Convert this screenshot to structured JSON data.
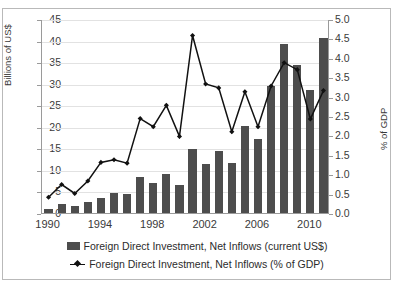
{
  "chart_data": {
    "type": "bar",
    "title": "",
    "xlabel": "",
    "ylabel": "Billions of US$",
    "y2label": "% of GDP",
    "grid": true,
    "legend_position": "bottom",
    "categories": [
      "1990",
      "1991",
      "1992",
      "1993",
      "1994",
      "1995",
      "1996",
      "1997",
      "1998",
      "1999",
      "2000",
      "2001",
      "2002",
      "2003",
      "2004",
      "2005",
      "2006",
      "2007",
      "2008",
      "2009",
      "2010",
      "2011"
    ],
    "xtick_labels": [
      "1990",
      "1994",
      "1998",
      "2002",
      "2006",
      "2010"
    ],
    "ylim": [
      0,
      45
    ],
    "ytick_labels": [
      "0",
      "5",
      "10",
      "15",
      "20",
      "25",
      "30",
      "35",
      "40",
      "45"
    ],
    "y2lim": [
      0,
      5.0
    ],
    "y2tick_labels": [
      "0.0",
      "0.5",
      "1.0",
      "1.5",
      "2.0",
      "2.5",
      "3.0",
      "3.5",
      "4.0",
      "4.5",
      "5.0"
    ],
    "series": [
      {
        "name": "Foreign Direct Investment, Net Inflows (current US$)",
        "kind": "bar",
        "axis": "left",
        "unit": "Billions of US$",
        "color": "#4d4d4d",
        "values": [
          1.0,
          2.1,
          1.7,
          2.5,
          3.5,
          4.6,
          4.4,
          8.4,
          7.0,
          9.0,
          6.6,
          14.9,
          11.4,
          14.3,
          11.6,
          20.2,
          17.1,
          29.5,
          39.1,
          34.3,
          28.6,
          40.6
        ]
      },
      {
        "name": "Foreign Direct Investment, Net Inflows (% of GDP)",
        "kind": "line",
        "axis": "right",
        "unit": "% of GDP",
        "color": "#111111",
        "values": [
          0.43,
          0.76,
          0.53,
          0.85,
          1.33,
          1.4,
          1.31,
          2.46,
          2.25,
          2.8,
          2.0,
          4.6,
          3.35,
          3.25,
          2.12,
          3.15,
          2.25,
          3.3,
          3.9,
          3.72,
          2.45,
          3.18
        ]
      }
    ]
  },
  "legend": {
    "bar_label": "Foreign Direct Investment, Net Inflows (current US$)",
    "line_label": "Foreign Direct Investment, Net Inflows (% of GDP)"
  },
  "axes": {
    "left_title": "Billions of US$",
    "right_title": "% of GDP"
  }
}
